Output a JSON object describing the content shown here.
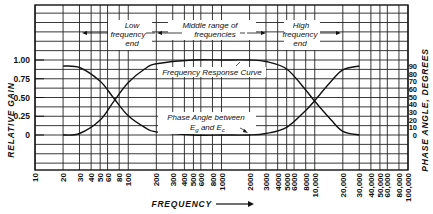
{
  "chart_data": {
    "type": "line",
    "title": "",
    "xlabel": "FREQUENCY",
    "ylabel": "RELATIVE GAIN",
    "ylabel_right": "PHASE ANGLE, DEGREES",
    "xscale": "log",
    "xlim": [
      10,
      100000
    ],
    "ylim_left": [
      0,
      1.0
    ],
    "ylim_right": [
      0,
      90
    ],
    "grid": true,
    "x_ticks": [
      "10",
      "20",
      "30",
      "40",
      "50",
      "60",
      "80",
      "100",
      "200",
      "300",
      "400",
      "500",
      "600",
      "800",
      "1000",
      "2000",
      "3000",
      "4000",
      "5000",
      "6000",
      "8000",
      "10,000",
      "20,000",
      "30,000",
      "40,000",
      "50,000",
      "60,000",
      "80,000",
      "100,000"
    ],
    "x_tick_values": [
      10,
      20,
      30,
      40,
      50,
      60,
      80,
      100,
      200,
      300,
      400,
      500,
      600,
      800,
      1000,
      2000,
      3000,
      4000,
      5000,
      6000,
      8000,
      10000,
      20000,
      30000,
      40000,
      50000,
      60000,
      80000,
      100000
    ],
    "y_ticks_left": [
      "1.00",
      "0.75",
      "0.50",
      "0.25",
      "0"
    ],
    "y_tick_values_left": [
      1.0,
      0.75,
      0.5,
      0.25,
      0
    ],
    "y_ticks_right": [
      "90",
      "80",
      "70",
      "60",
      "50",
      "40",
      "30",
      "20",
      "10",
      "0"
    ],
    "y_tick_values_right": [
      90,
      80,
      70,
      60,
      50,
      40,
      30,
      20,
      10,
      0
    ],
    "series": [
      {
        "name": "Frequency Response Curve",
        "axis": "left",
        "x": [
          20,
          30,
          50,
          70,
          100,
          150,
          200,
          500,
          1000,
          2000,
          3000,
          5000,
          8000,
          10000,
          15000,
          20000,
          30000
        ],
        "y": [
          0.0,
          0.02,
          0.2,
          0.45,
          0.7,
          0.88,
          0.95,
          1.0,
          1.0,
          1.0,
          0.98,
          0.88,
          0.6,
          0.45,
          0.2,
          0.05,
          0.0
        ]
      },
      {
        "name": "Phase Angle between Eg and Ec",
        "axis": "right",
        "x": [
          20,
          30,
          50,
          70,
          100,
          150,
          200,
          500,
          1000,
          2000,
          3000,
          5000,
          8000,
          10000,
          15000,
          20000,
          30000
        ],
        "y": [
          90,
          88,
          70,
          48,
          25,
          10,
          4,
          0,
          0,
          0,
          2,
          10,
          32,
          45,
          70,
          85,
          90
        ]
      }
    ],
    "annotations": [
      {
        "text": "Low frequency end",
        "region": [
          10,
          200
        ]
      },
      {
        "text": "Middle range of frequencies",
        "region": [
          200,
          3000
        ]
      },
      {
        "text": "High frequency end",
        "region": [
          3000,
          30000
        ]
      },
      {
        "text": "Frequency Response Curve"
      },
      {
        "text": "Phase Angle between Eg and Ec"
      }
    ]
  },
  "labels": {
    "y_left": "RELATIVE GAIN",
    "y_right": "PHASE ANGLE, DEGREES",
    "x": "FREQUENCY",
    "low_1": "Low",
    "low_2": "frequency",
    "low_3": "end",
    "mid_1": "Middle range of",
    "mid_2": "frequencies",
    "high_1": "High",
    "high_2": "frequency",
    "high_3": "end",
    "freq_curve": "Frequency Response Curve",
    "phase_1": "Phase Angle between",
    "phase_2": "E",
    "phase_sub_g": "g",
    "phase_and": " and E",
    "phase_sub_c": "c"
  }
}
